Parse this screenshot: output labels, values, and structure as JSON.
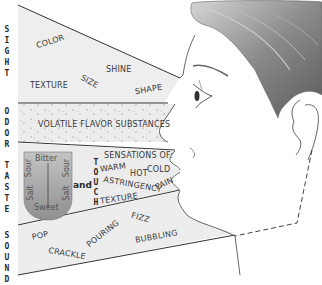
{
  "diagram": {
    "sections": [
      {
        "id": "sight",
        "label": "SIGHT",
        "stacked": "S\nI\nG\nH\nT",
        "terms": [
          "COLOR",
          "SHINE",
          "TEXTURE",
          "SIZE",
          "SHAPE"
        ]
      },
      {
        "id": "odor",
        "label": "ODOR",
        "stacked": "O\nD\nO\nR",
        "terms": [
          "VOLATILE FLAVOR SUBSTANCES"
        ]
      },
      {
        "id": "taste",
        "label": "TASTE",
        "stacked": "T\nA\nS\nT\nE",
        "tongue": {
          "top": "Bitter",
          "left_upper": "Sour",
          "right_upper": "Sour",
          "left_lower": "Salt",
          "right_lower": "Salt",
          "bottom": "Sweet"
        },
        "connector": "and"
      },
      {
        "id": "touch",
        "label": "TOUCH",
        "stacked": "T\nO\nU\nC\nH",
        "header": "SENSATIONS OF:",
        "terms": [
          "WARM",
          "HOT",
          "COLD",
          "ASTRINGENCY",
          "PAIN",
          "TEXTURE"
        ]
      },
      {
        "id": "sound",
        "label": "SOUND",
        "stacked": "S\nO\nU\nN\nD",
        "terms": [
          "POP",
          "CRACKLE",
          "POURING",
          "FIZZ",
          "BUBBLING"
        ]
      }
    ],
    "colors": {
      "band_fill": "#ebebeb",
      "band_stroke": "#333333",
      "tongue_fill": "#a9a9a9",
      "hair_dark": "#6e6e6e",
      "hair_light": "#bdbdbd",
      "outline": "#555555"
    }
  }
}
